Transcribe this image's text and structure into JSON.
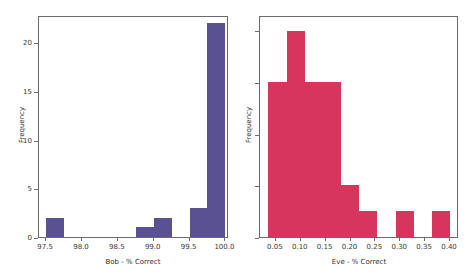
{
  "figure": {
    "width": 470,
    "height": 274,
    "background": "#ffffff",
    "panels": 2
  },
  "chart_data": [
    {
      "id": "bob-histogram",
      "type": "bar",
      "title": "",
      "xlabel": "Bob - % Correct",
      "ylabel": "Frequency",
      "color": "#595192",
      "xlim": [
        97.4,
        100.05
      ],
      "ylim": [
        0,
        22.8
      ],
      "grid": false,
      "legend": null,
      "bin_width": 0.25,
      "bin_edges": [
        97.5,
        97.75,
        98.0,
        98.25,
        98.5,
        98.75,
        99.0,
        99.25,
        99.5,
        99.75,
        100.0
      ],
      "bin_centers": [
        97.625,
        97.875,
        98.125,
        98.375,
        98.625,
        98.875,
        99.125,
        99.375,
        99.625,
        99.875
      ],
      "values": [
        2,
        0,
        0,
        0,
        0,
        1,
        2,
        0,
        3,
        22
      ],
      "xticks": [
        97.5,
        98.0,
        98.5,
        99.0,
        99.5,
        100.0
      ],
      "xtick_labels": [
        "97.5",
        "98.0",
        "98.5",
        "99.0",
        "99.5",
        "100.0"
      ],
      "yticks": [
        0,
        5,
        10,
        15,
        20
      ],
      "ytick_labels": [
        "0",
        "5",
        "10",
        "15",
        "20"
      ]
    },
    {
      "id": "eve-histogram",
      "type": "bar",
      "title": "",
      "xlabel": "Eve - % Correct",
      "ylabel": "Frequency",
      "color": "#d6365c",
      "xlim": [
        0.018,
        0.418
      ],
      "ylim": [
        0,
        8.6
      ],
      "grid": false,
      "legend": null,
      "bin_width": 0.0365,
      "bin_edges": [
        0.035,
        0.0715,
        0.108,
        0.1445,
        0.181,
        0.2175,
        0.254,
        0.2905,
        0.327,
        0.3635,
        0.4
      ],
      "bin_centers": [
        0.0533,
        0.0898,
        0.1263,
        0.1628,
        0.1993,
        0.2358,
        0.2723,
        0.3088,
        0.3453,
        0.3818
      ],
      "values": [
        6,
        8,
        6,
        6,
        2,
        1,
        0,
        1,
        0,
        1
      ],
      "xticks": [
        0.05,
        0.1,
        0.15,
        0.2,
        0.25,
        0.3,
        0.35,
        0.4
      ],
      "xtick_labels": [
        "0.05",
        "0.10",
        "0.15",
        "0.20",
        "0.25",
        "0.30",
        "0.35",
        "0.40"
      ],
      "yticks": [
        0,
        2,
        4,
        6,
        8
      ],
      "ytick_labels": [
        "",
        "",
        "",
        "",
        ""
      ]
    }
  ]
}
